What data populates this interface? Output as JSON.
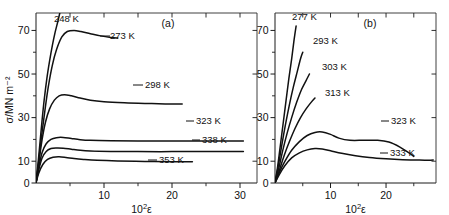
{
  "figure": {
    "background": "#ffffff",
    "ink": "#111111",
    "page_header_faint": "",
    "panels": [
      {
        "id": "a",
        "label": "(a)",
        "xlabel_base": "10",
        "xlabel_exp": "2",
        "xlabel_var": "ε",
        "ylabel": "σ/MN m⁻²",
        "x_major_ticks": [
          10,
          20,
          30
        ],
        "x_major_tick_labels": [
          "10",
          "20",
          "30"
        ],
        "x_minor_ticks": [
          5,
          15,
          25
        ],
        "y_major_ticks": [
          0,
          10,
          30,
          50,
          70
        ],
        "y_major_tick_labels": [
          "0",
          "10",
          "30",
          "50",
          "70"
        ],
        "y_minor_ticks": [
          20,
          40,
          60
        ],
        "xlim": [
          0,
          32.5
        ],
        "ylim": [
          0,
          78
        ],
        "curve_labels": [
          "248 K",
          "273 K",
          "298 K",
          "323 K",
          "338 K",
          "353 K"
        ]
      },
      {
        "id": "b",
        "label": "(b)",
        "xlabel_base": "10",
        "xlabel_exp": "2",
        "xlabel_var": "ε",
        "ylabel": "",
        "x_major_ticks": [
          10,
          20
        ],
        "x_major_tick_labels": [
          "10",
          "20"
        ],
        "x_minor_ticks": [
          5,
          15,
          25
        ],
        "y_major_ticks": [
          0,
          10,
          30,
          50,
          70
        ],
        "y_major_tick_labels": [
          "0",
          "10",
          "30",
          "50",
          "70"
        ],
        "y_minor_ticks": [
          20,
          40,
          60
        ],
        "xlim": [
          0,
          29
        ],
        "ylim": [
          0,
          78
        ],
        "curve_labels": [
          "277 K",
          "293 K",
          "303 K",
          "313 K",
          "323 K",
          "333 K"
        ]
      }
    ]
  },
  "chart_data": [
    {
      "type": "line",
      "panel": "a",
      "title": "(a)",
      "xlabel": "10²ε",
      "ylabel": "σ/MN m⁻²",
      "xlim": [
        0,
        32.5
      ],
      "ylim": [
        0,
        78
      ],
      "xticks": [
        0,
        10,
        20,
        30
      ],
      "yticks": [
        0,
        10,
        30,
        50,
        70
      ],
      "grid": false,
      "legend": "inline-curve-labels",
      "series": [
        {
          "name": "248 K",
          "label_position": "above-curve-top",
          "points": [
            [
              0,
              0
            ],
            [
              0.3,
              9
            ],
            [
              0.6,
              19
            ],
            [
              0.9,
              29
            ],
            [
              1.2,
              38
            ],
            [
              1.6,
              48
            ],
            [
              2.0,
              56
            ],
            [
              2.4,
              63
            ],
            [
              2.8,
              69
            ],
            [
              3.2,
              74
            ],
            [
              3.5,
              78
            ]
          ]
        },
        {
          "name": "273 K",
          "label_position": "right-of-peak",
          "points": [
            [
              0,
              0
            ],
            [
              0.4,
              10
            ],
            [
              0.8,
              21
            ],
            [
              1.3,
              33
            ],
            [
              1.8,
              44
            ],
            [
              2.4,
              54
            ],
            [
              3.0,
              61
            ],
            [
              3.8,
              67
            ],
            [
              4.6,
              69.5
            ],
            [
              5.6,
              70
            ],
            [
              6.6,
              69.5
            ],
            [
              8.0,
              68.5
            ],
            [
              9.5,
              67.5
            ],
            [
              11.0,
              66.8
            ],
            [
              12.0,
              66.5
            ]
          ]
        },
        {
          "name": "298 K",
          "label_position": "right-end",
          "points": [
            [
              0,
              0
            ],
            [
              0.4,
              9
            ],
            [
              0.9,
              20
            ],
            [
              1.4,
              28
            ],
            [
              2.0,
              34
            ],
            [
              2.7,
              38
            ],
            [
              3.4,
              40
            ],
            [
              4.2,
              40.5
            ],
            [
              5.2,
              40
            ],
            [
              6.5,
              39
            ],
            [
              8.0,
              38
            ],
            [
              10.0,
              37.3
            ],
            [
              13.0,
              36.8
            ],
            [
              16.0,
              36.5
            ],
            [
              19.0,
              36.3
            ],
            [
              21.5,
              36.2
            ]
          ]
        },
        {
          "name": "323 K",
          "label_position": "upper-right",
          "points": [
            [
              0,
              0
            ],
            [
              0.4,
              7
            ],
            [
              0.9,
              14
            ],
            [
              1.5,
              18
            ],
            [
              2.2,
              20
            ],
            [
              3.0,
              20.8
            ],
            [
              4.0,
              20.9
            ],
            [
              5.2,
              20.4
            ],
            [
              6.5,
              19.9
            ],
            [
              8.0,
              19.6
            ],
            [
              11.0,
              19.4
            ],
            [
              15.0,
              19.3
            ],
            [
              20.0,
              19.3
            ],
            [
              25.0,
              19.3
            ],
            [
              30.5,
              19.3
            ]
          ]
        },
        {
          "name": "338 K",
          "label_position": "right-end",
          "points": [
            [
              0,
              0
            ],
            [
              0.4,
              6
            ],
            [
              0.9,
              11.5
            ],
            [
              1.5,
              14.5
            ],
            [
              2.2,
              15.8
            ],
            [
              3.0,
              16.1
            ],
            [
              4.0,
              16.0
            ],
            [
              5.2,
              15.5
            ],
            [
              6.5,
              15.0
            ],
            [
              8.0,
              14.7
            ],
            [
              11.0,
              14.5
            ],
            [
              15.0,
              14.4
            ],
            [
              20.0,
              14.4
            ],
            [
              25.0,
              14.4
            ],
            [
              30.5,
              14.4
            ]
          ]
        },
        {
          "name": "353 K",
          "label_position": "right-end",
          "points": [
            [
              0,
              0
            ],
            [
              0.4,
              4.5
            ],
            [
              1.0,
              8.5
            ],
            [
              1.7,
              10.8
            ],
            [
              2.5,
              11.8
            ],
            [
              3.4,
              12.0
            ],
            [
              4.4,
              11.7
            ],
            [
              5.6,
              11.2
            ],
            [
              7.0,
              10.8
            ],
            [
              9.0,
              10.4
            ],
            [
              12.0,
              10.1
            ],
            [
              16.0,
              9.9
            ],
            [
              20.0,
              9.8
            ],
            [
              23.0,
              9.7
            ]
          ]
        }
      ]
    },
    {
      "type": "line",
      "panel": "b",
      "title": "(b)",
      "xlabel": "10²ε",
      "ylabel": "σ/MN m⁻²",
      "xlim": [
        0,
        29
      ],
      "ylim": [
        0,
        78
      ],
      "xticks": [
        0,
        10,
        20
      ],
      "yticks": [
        0,
        10,
        30,
        50,
        70
      ],
      "grid": false,
      "legend": "inline-curve-labels",
      "series": [
        {
          "name": "277 K",
          "label_position": "above-curve-top",
          "points": [
            [
              0,
              0
            ],
            [
              0.5,
              8
            ],
            [
              1.0,
              18
            ],
            [
              1.5,
              28
            ],
            [
              2.0,
              38
            ],
            [
              2.5,
              48
            ],
            [
              3.0,
              57
            ],
            [
              3.4,
              65
            ],
            [
              3.8,
              72
            ]
          ]
        },
        {
          "name": "293 K",
          "label_position": "above-curve-top",
          "points": [
            [
              0,
              0
            ],
            [
              0.6,
              8
            ],
            [
              1.2,
              17
            ],
            [
              1.9,
              27
            ],
            [
              2.6,
              36
            ],
            [
              3.3,
              44
            ],
            [
              4.0,
              51
            ],
            [
              4.6,
              57
            ],
            [
              5.0,
              60
            ]
          ]
        },
        {
          "name": "303 K",
          "label_position": "above-curve-top",
          "points": [
            [
              0,
              0
            ],
            [
              0.7,
              7
            ],
            [
              1.4,
              15
            ],
            [
              2.2,
              23
            ],
            [
              3.0,
              30
            ],
            [
              3.9,
              37
            ],
            [
              4.8,
              43
            ],
            [
              5.6,
              47
            ],
            [
              6.2,
              50
            ]
          ]
        },
        {
          "name": "313 K",
          "label_position": "above-curve-top",
          "points": [
            [
              0,
              0
            ],
            [
              0.8,
              6
            ],
            [
              1.7,
              13
            ],
            [
              2.6,
              19
            ],
            [
              3.6,
              25
            ],
            [
              4.6,
              30
            ],
            [
              5.6,
              34
            ],
            [
              6.5,
              37
            ],
            [
              7.2,
              39
            ]
          ]
        },
        {
          "name": "323 K",
          "label_position": "right-end",
          "points": [
            [
              0,
              0
            ],
            [
              0.8,
              5
            ],
            [
              1.8,
              10
            ],
            [
              3.0,
              15
            ],
            [
              4.4,
              19
            ],
            [
              5.8,
              21.8
            ],
            [
              7.2,
              23.2
            ],
            [
              8.5,
              23.4
            ],
            [
              10.0,
              22.3
            ],
            [
              11.5,
              20.6
            ],
            [
              13.5,
              19.6
            ],
            [
              16.0,
              19.6
            ],
            [
              18.5,
              19.6
            ],
            [
              20.5,
              18.8
            ],
            [
              22.5,
              16.5
            ],
            [
              24.0,
              14.0
            ],
            [
              25.0,
              12.2
            ]
          ]
        },
        {
          "name": "333 K",
          "label_position": "right-end",
          "points": [
            [
              0,
              0
            ],
            [
              0.8,
              4
            ],
            [
              1.8,
              8
            ],
            [
              3.0,
              11.5
            ],
            [
              4.4,
              13.8
            ],
            [
              5.8,
              15.2
            ],
            [
              7.2,
              15.8
            ],
            [
              8.5,
              15.6
            ],
            [
              10.0,
              14.8
            ],
            [
              12.0,
              13.6
            ],
            [
              14.5,
              12.5
            ],
            [
              17.0,
              11.7
            ],
            [
              20.0,
              11.1
            ],
            [
              23.0,
              10.7
            ],
            [
              26.0,
              10.5
            ],
            [
              28.5,
              10.5
            ]
          ]
        }
      ]
    }
  ],
  "annotations": {
    "panel_a_labels": [
      {
        "text": "248 K",
        "x": 54,
        "y": 22
      },
      {
        "text": "273 K",
        "x": 110,
        "y": 39
      },
      {
        "text": "298 K",
        "x": 145,
        "y": 88
      },
      {
        "text": "323 K",
        "x": 196,
        "y": 124
      },
      {
        "text": "338 K",
        "x": 202,
        "y": 143
      },
      {
        "text": "353 K",
        "x": 159,
        "y": 163
      }
    ],
    "panel_b_labels": [
      {
        "text": "277 K",
        "x": 292,
        "y": 20
      },
      {
        "text": "293 K",
        "x": 313,
        "y": 44
      },
      {
        "text": "303 K",
        "x": 322,
        "y": 70
      },
      {
        "text": "313 K",
        "x": 325,
        "y": 96
      },
      {
        "text": "323 K",
        "x": 391,
        "y": 124
      },
      {
        "text": "333 K",
        "x": 390,
        "y": 156
      }
    ]
  }
}
